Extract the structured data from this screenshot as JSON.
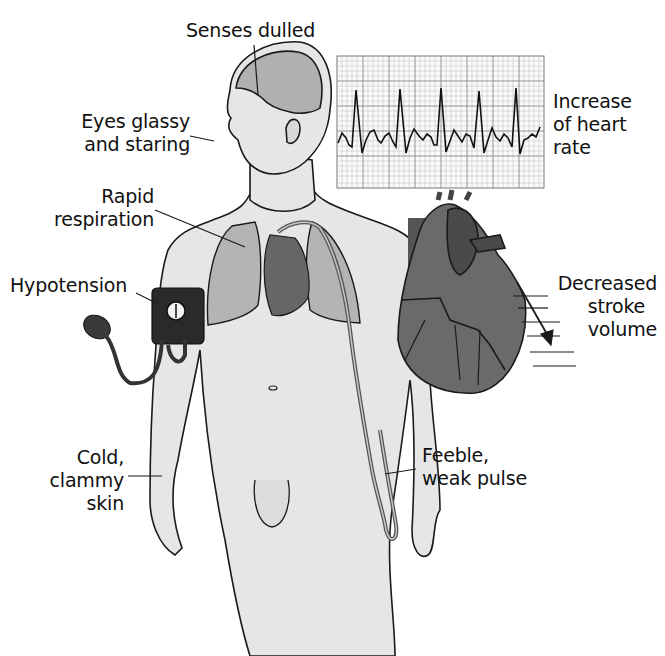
{
  "figure": {
    "type": "medical-illustration",
    "labels": {
      "senses": "Senses dulled",
      "eyes_1": "Eyes glassy",
      "eyes_2": "and staring",
      "resp_1": "Rapid",
      "resp_2": "respiration",
      "hypotension": "Hypotension",
      "skin_1": "Cold,",
      "skin_2": "clammy",
      "skin_3": "skin",
      "heart_rate_1": "Increase",
      "heart_rate_2": "of heart",
      "heart_rate_3": "rate",
      "stroke_1": "Decreased",
      "stroke_2": "stroke",
      "stroke_3": "volume",
      "pulse_1": "Feeble,",
      "pulse_2": "weak pulse"
    },
    "colors": {
      "body_fill": "#e6e6e6",
      "organ_fill": "#9a9a9a",
      "heart_dark": "#555555",
      "outline": "#1a1a1a",
      "grid": "#888888"
    }
  }
}
